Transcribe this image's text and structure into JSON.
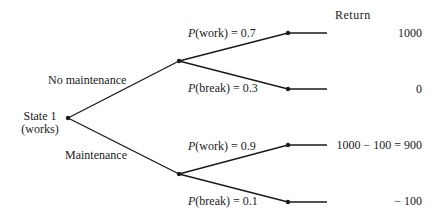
{
  "root": {
    "label_line1": "State 1",
    "label_line2": "(works)"
  },
  "decisions": [
    {
      "label": "No maintenance",
      "outcomes": [
        {
          "p_symbol": "P",
          "event": "(work) = 0.7",
          "return": "1000"
        },
        {
          "p_symbol": "P",
          "event": "(break) = 0.3",
          "return": "0"
        }
      ]
    },
    {
      "label": "Maintenance",
      "outcomes": [
        {
          "p_symbol": "P",
          "event": "(work) = 0.9",
          "return": "1000 − 100 = 900"
        },
        {
          "p_symbol": "P",
          "event": "(break) = 0.1",
          "return": "− 100"
        }
      ]
    }
  ],
  "return_header": "Return",
  "colors": {
    "line": "#1a1a1a",
    "background": "#ffffff"
  }
}
